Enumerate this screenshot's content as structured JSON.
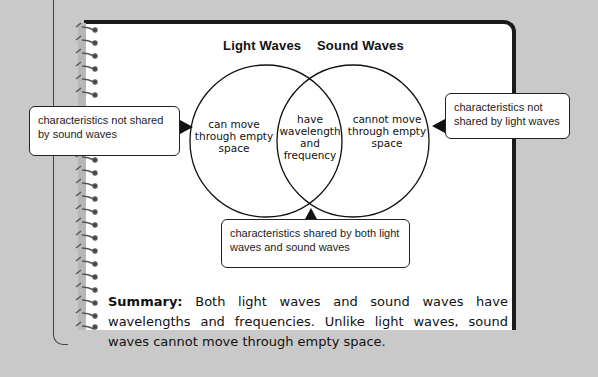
{
  "diagram": {
    "type": "venn",
    "sets": [
      {
        "title": "Light Waves",
        "unique_text": [
          "can move",
          "through empty",
          "space"
        ]
      },
      {
        "title": "Sound Waves",
        "unique_text": [
          "cannot move",
          "through empty",
          "space"
        ]
      }
    ],
    "intersection_text": [
      "have",
      "wavelength",
      "and",
      "frequency"
    ]
  },
  "callouts": {
    "left": "characteristics not shared by sound waves",
    "right": "characteristics not shared by light waves",
    "bottom": "characteristics shared by both light waves and sound waves"
  },
  "summary": {
    "label": "Summary:",
    "text": " Both light waves and sound waves have wavelengths and frequencies. Unlike light waves, sound waves cannot move through empty space."
  },
  "colors": {
    "background": "#c9c9c9",
    "page": "#ffffff",
    "ink": "#111111"
  }
}
